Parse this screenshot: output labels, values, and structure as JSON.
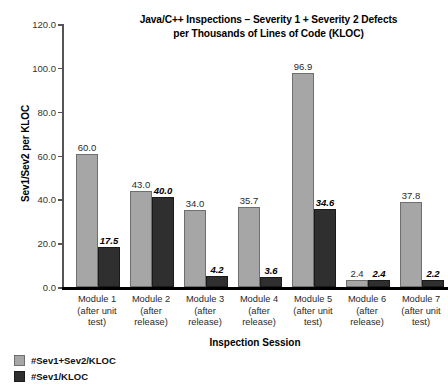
{
  "chart_data": {
    "type": "bar",
    "title": "Java/C++ Inspections – Severity 1 + Severity 2 Defects per Thousands of Lines of Code (KLOC)",
    "title_line1": "Java/C++ Inspections – Severity 1 + Severity 2 Defects",
    "title_line2": "per Thousands of Lines of Code (KLOC)",
    "xlabel": "Inspection Session",
    "ylabel": "Sev1/Sev2 per KLOC",
    "ylim": [
      0,
      120
    ],
    "ytick_step": 20,
    "ytick_labels": [
      "0.0",
      "20.0",
      "40.0",
      "60.0",
      "80.0",
      "100.0",
      "120.0"
    ],
    "ytick_values": [
      0,
      20,
      40,
      60,
      80,
      100,
      120
    ],
    "grid": false,
    "legend_position": "bottom-left",
    "categories": [
      "Module 1 (after unit test)",
      "Module 2 (after release)",
      "Module 3 (after release)",
      "Module 4 (after release)",
      "Module 5 (after unit test)",
      "Module 6 (after release)",
      "Module 7 (after unit test)"
    ],
    "category_lines": [
      [
        "Module 1",
        "(after unit",
        "test)"
      ],
      [
        "Module 2",
        "(after",
        "release)"
      ],
      [
        "Module 3",
        "(after",
        "release)"
      ],
      [
        "Module 4",
        "(after",
        "release)"
      ],
      [
        "Module 5",
        "(after unit",
        "test)"
      ],
      [
        "Module 6",
        "(after",
        "release)"
      ],
      [
        "Module 7",
        "(after unit",
        "test)"
      ]
    ],
    "series": [
      {
        "name": "#Sev1+Sev2/KLOC",
        "color": "#a6a6a6",
        "values": [
          60.0,
          43.0,
          34.0,
          35.7,
          96.9,
          2.4,
          37.8
        ],
        "labels": [
          "60.0",
          "43.0",
          "34.0",
          "35.7",
          "96.9",
          "2.4",
          "37.8"
        ]
      },
      {
        "name": "#Sev1/KLOC",
        "color": "#2f2f2f",
        "values": [
          17.5,
          40.0,
          4.2,
          3.6,
          34.6,
          2.4,
          2.2
        ],
        "labels": [
          "17.5",
          "40.0",
          "4.2",
          "3.6",
          "34.6",
          "2.4",
          "2.2"
        ]
      }
    ]
  },
  "legend": {
    "items": [
      {
        "label": "#Sev1+Sev2/KLOC",
        "swatch": "light"
      },
      {
        "label": "#Sev1/KLOC",
        "swatch": "dark"
      }
    ]
  }
}
